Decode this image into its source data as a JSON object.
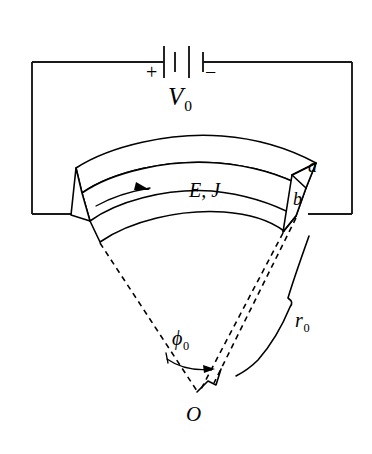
{
  "figure": {
    "background_color": "#ffffff",
    "line_color": "#000000",
    "width": 372,
    "height": 454
  },
  "labels": {
    "source_voltage": "V",
    "source_voltage_sub": "0",
    "terminal_positive": "+",
    "terminal_negative": "−",
    "field_and_current": "E, J",
    "outer_radius_edge": "a",
    "inner_radius_edge": "b",
    "angle_symbol": "ϕ",
    "angle_sub": "0",
    "radius_symbol": "r",
    "radius_sub": "0",
    "origin": "O"
  },
  "elements": {
    "battery": {
      "name": "battery-symbol",
      "plate_count": 4,
      "polarity_left": "+",
      "polarity_right": "−"
    },
    "circuit_loop": {
      "name": "circuit-wire-loop",
      "shape": "rectangle"
    },
    "conductor": {
      "name": "curved-conductor-block",
      "shape": "annular-sector-prism",
      "current_direction": "left-to-right"
    },
    "current_arrow": {
      "name": "current-direction-arrow"
    },
    "angle_arc": {
      "name": "angle-arc-phi0"
    },
    "radius_brace": {
      "name": "radius-indicator-r0"
    },
    "dashed_radii": {
      "name": "construction-dashed-radii",
      "count": 3
    }
  }
}
